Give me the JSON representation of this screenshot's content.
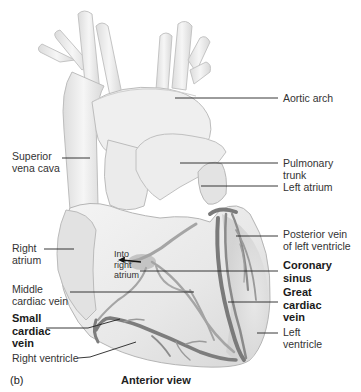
{
  "figure": {
    "panel_label": "(b)",
    "caption": "Anterior view",
    "colors": {
      "background": "#ffffff",
      "heart_fill": "#ececec",
      "heart_shadow": "#d2d2d2",
      "heart_outline": "#b8b8b8",
      "vein_dark": "#777777",
      "vein_mid": "#a3a3a3",
      "leader_line": "#222222"
    }
  },
  "labels": {
    "aortic_arch": "Aortic arch",
    "superior_vena_cava": "Superior\nvena cava",
    "pulmonary_trunk": "Pulmonary\ntrunk",
    "left_atrium": "Left atrium",
    "right_atrium": "Right\natrium",
    "posterior_vein": "Posterior vein\nof left ventricle",
    "into_right_atrium": "Into\nright\natrium",
    "coronary_sinus": "Coronary\nsinus",
    "middle_cardiac_vein": "Middle\ncardiac vein",
    "great_cardiac_vein": "Great\ncardiac\nvein",
    "small_cardiac_vein": "Small\ncardiac\nvein",
    "left_ventricle": "Left\nventricle",
    "right_ventricle": "Right ventricle"
  }
}
